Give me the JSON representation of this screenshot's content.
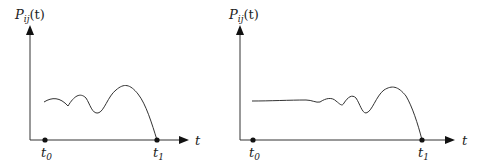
{
  "diagrams": [
    {
      "ylabel": "P",
      "ylabel_sub": "ij",
      "ylabel_arg": "(t)",
      "xlabel": "t",
      "t0_label": "t",
      "t0_sub": "0",
      "t1_label": "t",
      "t1_sub": "1",
      "description": "Wavy curve starting at t0 level, decaying to zero at t1"
    },
    {
      "ylabel": "P",
      "ylabel_sub": "ij",
      "ylabel_arg": "(t)",
      "xlabel": "t",
      "t0_label": "t",
      "t0_sub": "0",
      "t1_label": "t",
      "t1_sub": "1",
      "description": "Flat curve then oscillations growing, decaying to zero at t1"
    }
  ]
}
